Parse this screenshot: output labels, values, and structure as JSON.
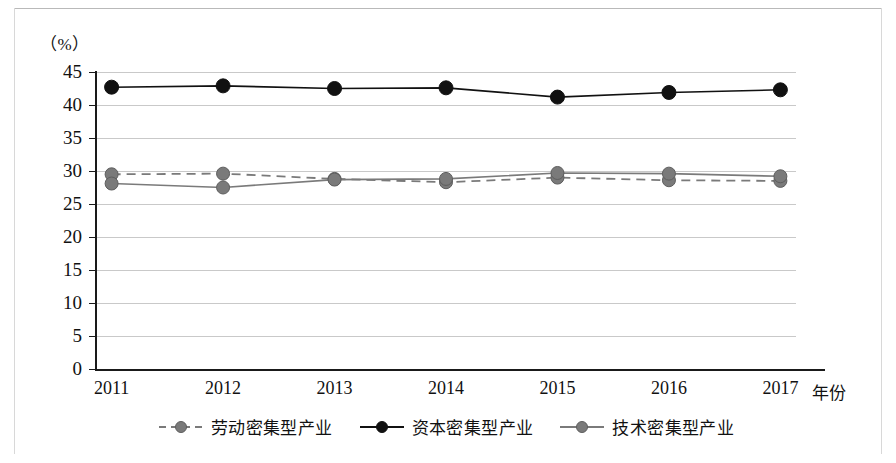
{
  "figure": {
    "unit_label": "（%）",
    "x_axis_title": "年份"
  },
  "chart_data": {
    "type": "line",
    "title": "",
    "xlabel": "年份",
    "ylabel": "（%）",
    "ylim": [
      0,
      45
    ],
    "ytick_step": 5,
    "grid": true,
    "legend_position": "bottom-center",
    "categories": [
      "2011",
      "2012",
      "2013",
      "2014",
      "2015",
      "2016",
      "2017"
    ],
    "yticks": [
      "0",
      "5",
      "10",
      "15",
      "20",
      "25",
      "30",
      "35",
      "40",
      "45"
    ],
    "series": [
      {
        "name": "劳动密集型产业",
        "style": "dashed",
        "marker": "circle",
        "color": "#7a7a7a",
        "values": [
          29.5,
          29.6,
          28.8,
          28.3,
          29.0,
          28.6,
          28.5
        ]
      },
      {
        "name": "资本密集型产业",
        "style": "solid",
        "marker": "circle",
        "color": "#111111",
        "values": [
          42.7,
          42.9,
          42.5,
          42.6,
          41.2,
          41.9,
          42.3
        ]
      },
      {
        "name": "技术密集型产业",
        "style": "solid",
        "marker": "circle",
        "color": "#7a7a7a",
        "values": [
          28.1,
          27.5,
          28.7,
          28.8,
          29.7,
          29.6,
          29.2
        ]
      }
    ]
  }
}
